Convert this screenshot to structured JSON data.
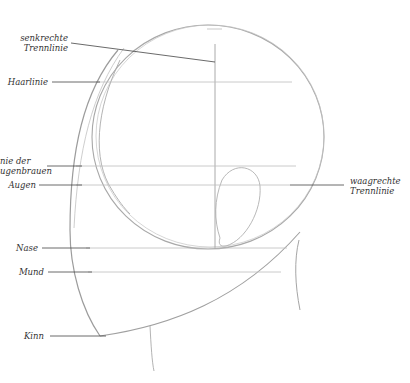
{
  "diagram": {
    "colors": {
      "sketch": "#9a9a9a",
      "guide": "#b8b8b8",
      "leader": "#444444",
      "text": "#333333"
    },
    "labels": {
      "senkrechte": {
        "line1": "senkrechte",
        "line2": "Trennlinie"
      },
      "haarlinie": "Haarlinie",
      "augenbrauen": {
        "line1": "nie der",
        "line2": "ugenbrauen"
      },
      "augen": "Augen",
      "waagrechte": {
        "line1": "waagrechte",
        "line2": "Trennlinie"
      },
      "nase": "Nase",
      "mund": "Mund",
      "kinn": "Kinn"
    }
  }
}
